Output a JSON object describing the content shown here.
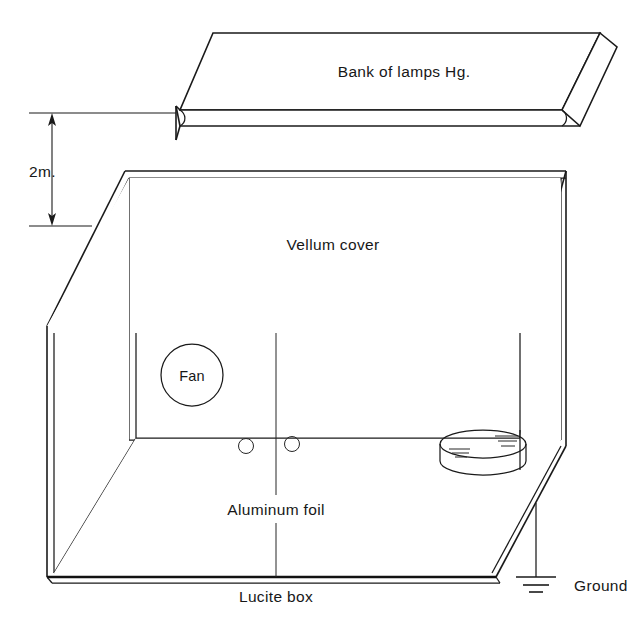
{
  "figure": {
    "kind": "technical-line-diagram",
    "background_color": "#ffffff",
    "line_color": "#1a1a1a"
  },
  "labels": {
    "lamp_bank": "Bank of lamps Hg.",
    "gap_dimension": "2m.",
    "cover": "Vellum cover",
    "fan": "Fan",
    "floor": "Aluminum foil",
    "box": "Lucite box",
    "ground": "Ground"
  },
  "components": [
    {
      "id": "lamp-bank",
      "label": "Bank of lamps Hg.",
      "description": "Flat rectangular slab shown in oblique projection above the box"
    },
    {
      "id": "gap-dimension",
      "label": "2m.",
      "description": "Double headed vertical arrow between lamp bank and box top"
    },
    {
      "id": "vellum-cover",
      "label": "Vellum cover",
      "description": "Parallelogram top face of the box"
    },
    {
      "id": "fan",
      "label": "Fan",
      "description": "Circular fan on the rear wall of the box"
    },
    {
      "id": "sample-holes",
      "label": "",
      "description": "Two small open circles on the foil floor"
    },
    {
      "id": "petri-dish",
      "label": "",
      "description": "Shallow cylindrical dish on the floor at right"
    },
    {
      "id": "aluminum-foil",
      "label": "Aluminum foil",
      "description": "Floor of the box lined with foil, seam line down the centre"
    },
    {
      "id": "lucite-box",
      "label": "Lucite box",
      "description": "Transparent box enclosure with thick base edge"
    },
    {
      "id": "ground",
      "label": "Ground",
      "description": "Earth ground symbol wired to the box front right edge"
    }
  ],
  "ground_symbol": {
    "bars": 3,
    "description": "Vertical stem with three decreasing horizontal bars"
  }
}
